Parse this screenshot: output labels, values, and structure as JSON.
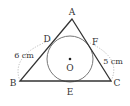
{
  "diagram": {
    "type": "triangle-with-incircle",
    "vertices": {
      "A": {
        "label": "A",
        "x": 72,
        "y": 19
      },
      "B": {
        "label": "B",
        "x": 20,
        "y": 81
      },
      "C": {
        "label": "C",
        "x": 111,
        "y": 81
      }
    },
    "tangent_points": {
      "D": {
        "label": "D"
      },
      "E": {
        "label": "E"
      },
      "F": {
        "label": "F"
      }
    },
    "center": {
      "label": "O",
      "x": 70,
      "y": 59,
      "radius": 23
    },
    "measurements": {
      "BD": "6 cm",
      "CF": "5 cm"
    },
    "colors": {
      "line": "#333333",
      "circle": "#777777",
      "dotted": "#999999"
    }
  }
}
